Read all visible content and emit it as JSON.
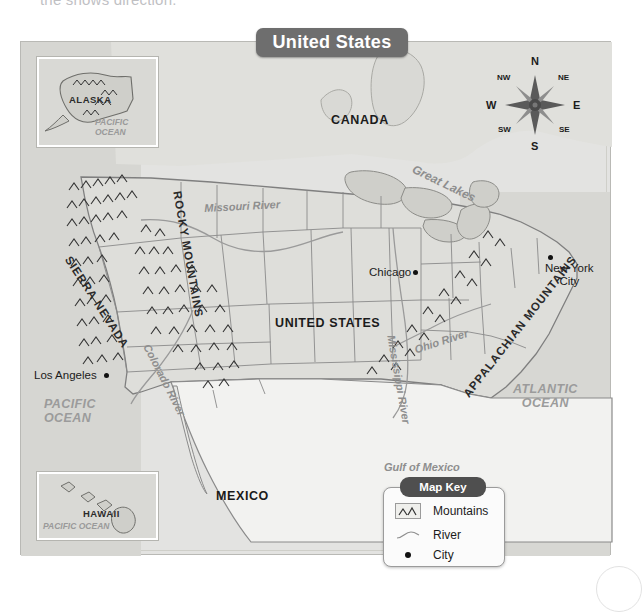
{
  "page": {
    "top_partial_text": "the shows direction."
  },
  "map": {
    "title": "United States",
    "countries": [
      {
        "name": "CANADA"
      },
      {
        "name": "UNITED STATES"
      },
      {
        "name": "MEXICO"
      }
    ],
    "oceans": [
      {
        "name": "PACIFIC OCEAN",
        "line1": "PACIFIC",
        "line2": "OCEAN"
      },
      {
        "name": "ATLANTIC OCEAN",
        "line1": "ATLANTIC",
        "line2": "OCEAN"
      }
    ],
    "water_bodies": [
      {
        "name": "Gulf of Mexico"
      },
      {
        "name": "Great Lakes"
      }
    ],
    "rivers": [
      {
        "name": "Missouri River"
      },
      {
        "name": "Mississippi River"
      },
      {
        "name": "Ohio River"
      },
      {
        "name": "Colorado River"
      }
    ],
    "mountain_ranges": [
      {
        "name": "ROCKY MOUNTAINS"
      },
      {
        "name": "SIERRA NEVADA"
      },
      {
        "name": "APPALACHIAN MOUNTAINS"
      }
    ],
    "cities": [
      {
        "name": "Los Angeles",
        "line1": "Los Angeles",
        "line2": ""
      },
      {
        "name": "Chicago",
        "line1": "Chicago",
        "line2": ""
      },
      {
        "name": "New York City",
        "line1": "New York",
        "line2": "City"
      }
    ],
    "insets": [
      {
        "label": "ALASKA",
        "ocean_line1": "PACIFIC",
        "ocean_line2": "OCEAN"
      },
      {
        "label": "HAWAII",
        "ocean_line1": "PACIFIC OCEAN",
        "ocean_line2": ""
      }
    ]
  },
  "compass": {
    "north": "N",
    "northeast": "NE",
    "east": "E",
    "southeast": "SE",
    "south": "S",
    "southwest": "SW",
    "west": "W",
    "northwest": "NW"
  },
  "map_key": {
    "title": "Map Key",
    "items": [
      {
        "label": "Mountains",
        "icon": "mountains-symbol"
      },
      {
        "label": "River",
        "icon": "river-symbol"
      },
      {
        "label": "City",
        "icon": "city-dot-symbol"
      }
    ]
  },
  "colors": {
    "banner": "#6e6e6e",
    "key_banner": "#4f4f4f",
    "land": "#dededa",
    "ocean": "#d6d6d2",
    "label_dark": "#1b1b1b",
    "label_gray": "#9b9b9b"
  }
}
